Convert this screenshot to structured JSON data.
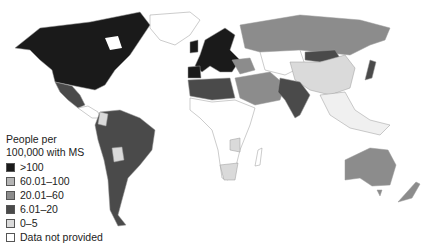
{
  "legend": {
    "title_line1": "People per",
    "title_line2": "100,000 with MS",
    "items": [
      {
        "label": ">100",
        "color": "#1a1a1a"
      },
      {
        "label": "60.01–100",
        "color": "#b4b4b4"
      },
      {
        "label": "20.01–60",
        "color": "#8c8c8c"
      },
      {
        "label": "6.01–20",
        "color": "#4a4a4a"
      },
      {
        "label": "0–5",
        "color": "#dadada"
      },
      {
        "label": "Data not provided",
        "color": "#ffffff"
      }
    ]
  },
  "regions": [
    {
      "name": "North America (USA/Canada)",
      "category": ">100"
    },
    {
      "name": "Mexico",
      "category": "6.01–20"
    },
    {
      "name": "South America (most)",
      "category": "6.01–20"
    },
    {
      "name": "Bolivia",
      "category": "0–5"
    },
    {
      "name": "Northern Europe",
      "category": ">100"
    },
    {
      "name": "Russia",
      "category": "20.01–60"
    },
    {
      "name": "North Africa",
      "category": "6.01–20"
    },
    {
      "name": "Middle East",
      "category": "20.01–60"
    },
    {
      "name": "India",
      "category": "6.01–20"
    },
    {
      "name": "Mongolia",
      "category": "6.01–20"
    },
    {
      "name": "China",
      "category": "0–5"
    },
    {
      "name": "Japan",
      "category": "6.01–20"
    },
    {
      "name": "Australia",
      "category": "20.01–60"
    },
    {
      "name": "New Zealand",
      "category": "20.01–60"
    },
    {
      "name": "Southern Africa",
      "category": "0–5"
    },
    {
      "name": "Sub-Saharan Africa (most)",
      "category": "Data not provided"
    }
  ]
}
